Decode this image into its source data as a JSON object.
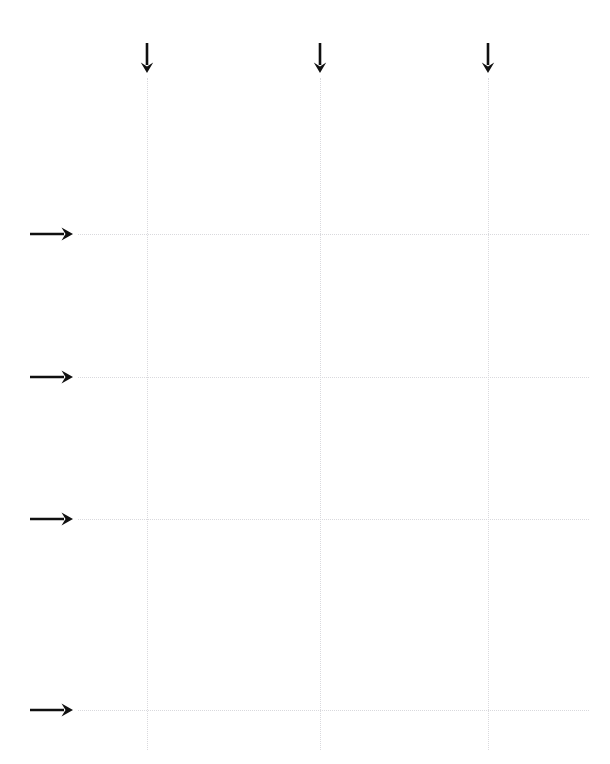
{
  "page": {
    "width": 610,
    "height": 764,
    "background_color": "#ffffff"
  },
  "style": {
    "grid_line_color": "#d9d9dd",
    "grid_line_style": "dotted",
    "grid_line_width_px": 1,
    "arrow_color": "#101010",
    "arrow_stroke_width_px": 2.6
  },
  "chart_data": {
    "type": "scatter",
    "title": "",
    "subtitle": "",
    "xlabel": "",
    "ylabel": "",
    "grid": true,
    "legend_position": "none",
    "annotations": [],
    "series": [],
    "vertical_guides": [
      {
        "id": "v1",
        "label": "",
        "x_px": 147,
        "top_px": 78,
        "bottom_px": 750
      },
      {
        "id": "v2",
        "label": "",
        "x_px": 320,
        "top_px": 78,
        "bottom_px": 750
      },
      {
        "id": "v3",
        "label": "",
        "x_px": 488,
        "top_px": 78,
        "bottom_px": 750
      }
    ],
    "horizontal_guides": [
      {
        "id": "h1",
        "label": "",
        "y_px": 234,
        "left_px": 78,
        "right_px": 589
      },
      {
        "id": "h2",
        "label": "",
        "y_px": 377,
        "left_px": 78,
        "right_px": 589
      },
      {
        "id": "h3",
        "label": "",
        "y_px": 519,
        "left_px": 78,
        "right_px": 589
      },
      {
        "id": "h4",
        "label": "",
        "y_px": 710,
        "left_px": 78,
        "right_px": 589
      }
    ],
    "down_arrows": [
      {
        "id": "down-arrow-1",
        "x_px": 147,
        "tail_y_px": 43,
        "head_y_px": 73
      },
      {
        "id": "down-arrow-2",
        "x_px": 320,
        "tail_y_px": 43,
        "head_y_px": 73
      },
      {
        "id": "down-arrow-3",
        "x_px": 488,
        "tail_y_px": 43,
        "head_y_px": 73
      }
    ],
    "right_arrows": [
      {
        "id": "right-arrow-1",
        "y_px": 234,
        "tail_x_px": 30,
        "head_x_px": 73
      },
      {
        "id": "right-arrow-2",
        "y_px": 377,
        "tail_x_px": 30,
        "head_x_px": 73
      },
      {
        "id": "right-arrow-3",
        "y_px": 519,
        "tail_x_px": 30,
        "head_x_px": 73
      },
      {
        "id": "right-arrow-4",
        "y_px": 710,
        "tail_x_px": 30,
        "head_x_px": 73
      }
    ]
  }
}
